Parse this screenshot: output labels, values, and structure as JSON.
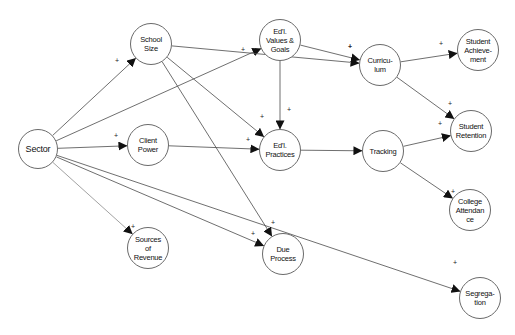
{
  "diagram": {
    "type": "path-diagram",
    "nodes": [
      {
        "id": "sector",
        "label": "Sector",
        "x": 38,
        "y": 149,
        "r": 20
      },
      {
        "id": "school_size",
        "label": "School\nSize",
        "x": 151,
        "y": 44,
        "r": 21
      },
      {
        "id": "client_power",
        "label": "Client\nPower",
        "x": 148,
        "y": 145,
        "r": 21
      },
      {
        "id": "sources_of_revenue",
        "label": "Sources\nof\nRevenue",
        "x": 148,
        "y": 248,
        "r": 21
      },
      {
        "id": "edl_values_goals",
        "label": "Ed'l.\nValues &\nGoals",
        "x": 280,
        "y": 40,
        "r": 21
      },
      {
        "id": "edl_practices",
        "label": "Ed'l.\nPractices",
        "x": 280,
        "y": 150,
        "r": 21
      },
      {
        "id": "due_process",
        "label": "Due\nProcess",
        "x": 283,
        "y": 254,
        "r": 21
      },
      {
        "id": "curriculum",
        "label": "Curricu-\nlum",
        "x": 380,
        "y": 65,
        "r": 21
      },
      {
        "id": "tracking",
        "label": "Tracking",
        "x": 383,
        "y": 151,
        "r": 21
      },
      {
        "id": "student_achievement",
        "label": "Student\nAchieve-\nment",
        "x": 478,
        "y": 50,
        "r": 21
      },
      {
        "id": "student_retention",
        "label": "Student\nRetention",
        "x": 471,
        "y": 131,
        "r": 21
      },
      {
        "id": "college_attendance",
        "label": "College\nAttendan\nce",
        "x": 470,
        "y": 210,
        "r": 21
      },
      {
        "id": "segregation",
        "label": "Segrega-\ntion",
        "x": 480,
        "y": 298,
        "r": 21
      }
    ],
    "edges": [
      {
        "from": "sector",
        "to": "school_size",
        "sign": "+",
        "sx": 117,
        "sy": 60
      },
      {
        "from": "sector",
        "to": "edl_values_goals",
        "sign": "+",
        "sx": 243,
        "sy": 49
      },
      {
        "from": "sector",
        "to": "client_power",
        "sign": "+",
        "sx": 116,
        "sy": 135
      },
      {
        "from": "sector",
        "to": "sources_of_revenue",
        "sign": "+",
        "sx": 133,
        "sy": 226,
        "light": true
      },
      {
        "from": "sector",
        "to": "due_process",
        "sign": "+",
        "sx": 253,
        "sy": 233
      },
      {
        "from": "sector",
        "to": "segregation",
        "sign": "+",
        "sx": 455,
        "sy": 262
      },
      {
        "from": "school_size",
        "to": "curriculum",
        "sign": "+",
        "sx": 350,
        "sy": 46
      },
      {
        "from": "school_size",
        "to": "edl_practices",
        "sign": "+",
        "sx": 262,
        "sy": 116
      },
      {
        "from": "school_size",
        "to": "due_process",
        "sign": "+",
        "sx": 273,
        "sy": 222
      },
      {
        "from": "client_power",
        "to": "edl_practices",
        "sign": "+",
        "sx": 248,
        "sy": 139
      },
      {
        "from": "edl_values_goals",
        "to": "curriculum",
        "sign": "+",
        "sx": 350,
        "sy": 46
      },
      {
        "from": "edl_values_goals",
        "to": "edl_practices",
        "sign": "+",
        "sx": 289,
        "sy": 109
      },
      {
        "from": "edl_practices",
        "to": "tracking",
        "sign": ""
      },
      {
        "from": "curriculum",
        "to": "student_achievement",
        "sign": "+",
        "sx": 441,
        "sy": 43
      },
      {
        "from": "curriculum",
        "to": "student_retention",
        "sign": "+",
        "sx": 450,
        "sy": 103
      },
      {
        "from": "tracking",
        "to": "student_retention",
        "sign": "+",
        "sx": 440,
        "sy": 123
      },
      {
        "from": "tracking",
        "to": "college_attendance",
        "sign": "+",
        "sx": 453,
        "sy": 191
      }
    ]
  },
  "colors": {
    "line": "#4a4a4a",
    "line_light": "#8a8a8a",
    "arrow": "#111111",
    "node_border": "#6a6a6a",
    "background": "#ffffff"
  }
}
